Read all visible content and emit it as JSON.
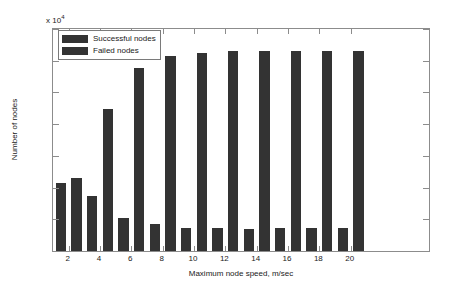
{
  "chart_data": {
    "type": "bar",
    "title": "",
    "subtitle": "",
    "xlabel": "Maximum node speed, m/sec",
    "ylabel": "Number of nodes",
    "y_exponent_label": "x 10",
    "y_exponent_power": "4",
    "categories": [
      "2",
      "4",
      "6",
      "8",
      "10",
      "12",
      "14",
      "16",
      "18",
      "20"
    ],
    "series": [
      {
        "name": "Successful nodes",
        "color": "#333333",
        "values": [
          10800,
          8700,
          5200,
          4200,
          3700,
          3700,
          3500,
          3700,
          3600,
          3600
        ]
      },
      {
        "name": "Failed nodes",
        "color": "#333333",
        "values": [
          11500,
          22400,
          28800,
          30800,
          31200,
          31500,
          31500,
          31500,
          31500,
          31500
        ]
      }
    ],
    "ylim": [
      0,
      35000
    ],
    "ytick_values": [
      0,
      5000,
      10000,
      15000,
      20000,
      25000,
      30000,
      35000
    ],
    "ytick_labels": [
      "0",
      "0.5",
      "1",
      "1.5",
      "2",
      "2.5",
      "3",
      "3.5"
    ],
    "xlim_categories": [
      0.5,
      12.5
    ],
    "grid": false,
    "legend_position": "top-left",
    "axis_color": "#8c8c8c",
    "background": "#ffffff"
  }
}
